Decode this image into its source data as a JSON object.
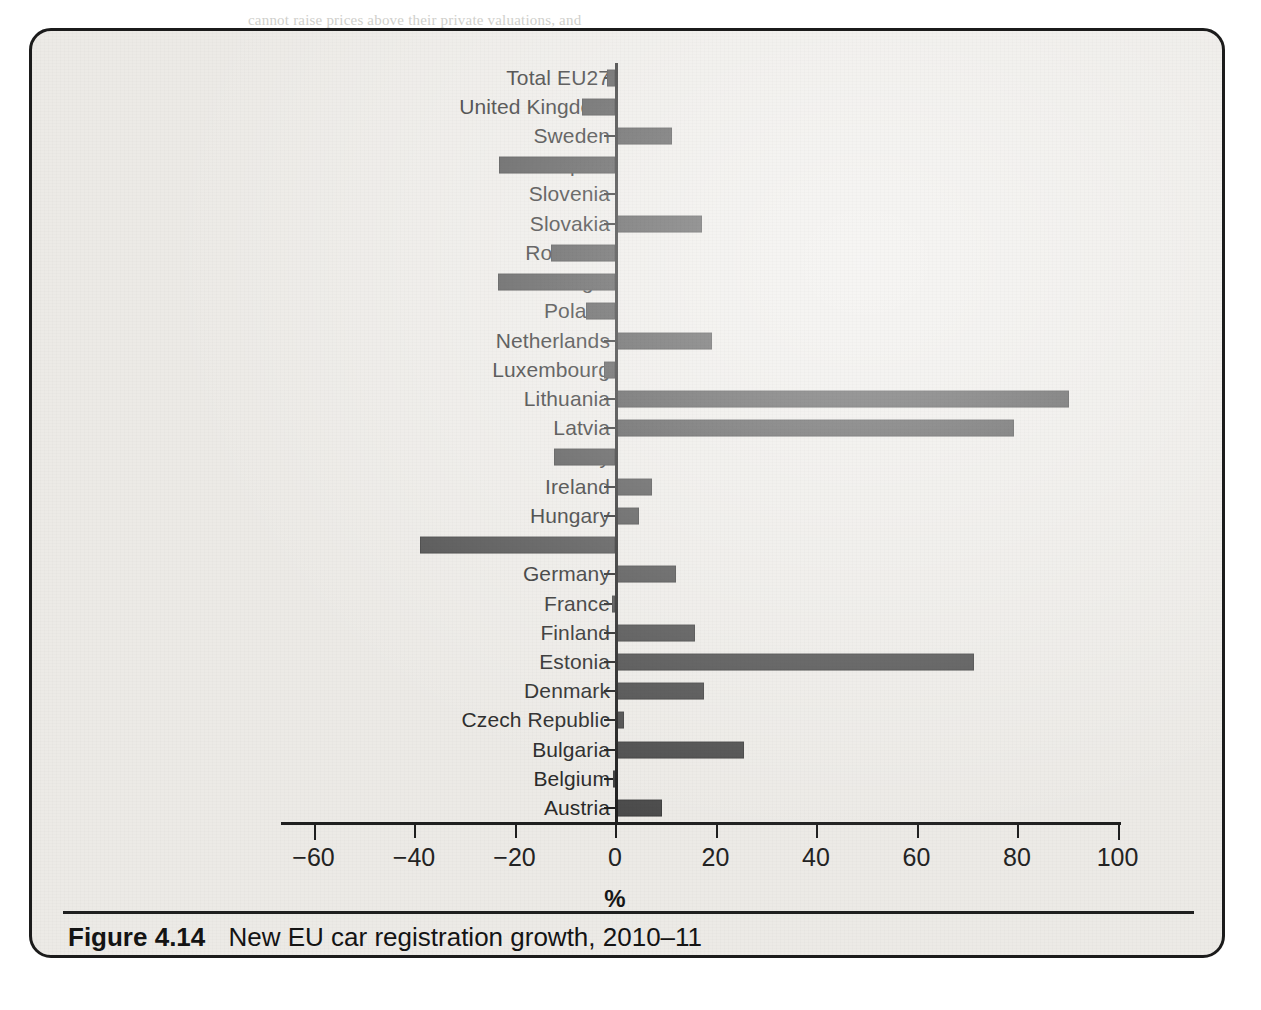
{
  "figure": {
    "number_label": "Figure 4.14",
    "caption": "New EU car registration growth, 2010–11",
    "bar_color": "#4b4b4b",
    "panel_color": "#eceae6",
    "axis_color": "#1f1f1f"
  },
  "chart_data": {
    "type": "bar",
    "orientation": "horizontal",
    "title": "New EU car registration growth, 2010–11",
    "xlabel": "%",
    "ylabel": "",
    "xlim": [
      -60,
      100
    ],
    "xticks": [
      -60,
      -40,
      -20,
      0,
      20,
      40,
      60,
      80,
      100
    ],
    "xtick_labels": [
      "−60",
      "−40",
      "−20",
      "0",
      "20",
      "40",
      "60",
      "80",
      "100"
    ],
    "grid": false,
    "legend": "none",
    "zero_reference_line": 0,
    "categories": [
      "Total EU27",
      "United Kingdom",
      "Sweden",
      "Spain",
      "Slovenia",
      "Slovakia",
      "Romania",
      "Portugal",
      "Poland",
      "Netherlands",
      "Luxembourg",
      "Lithuania",
      "Latvia",
      "Italy",
      "Ireland",
      "Hungary",
      "Greece",
      "Germany",
      "France",
      "Finland",
      "Estonia",
      "Denmark",
      "Czech Republic",
      "Bulgaria",
      "Belgium",
      "Austria"
    ],
    "values": [
      -1.5,
      -6.6,
      11.0,
      -23.0,
      0.0,
      17.0,
      -12.7,
      -23.3,
      -5.8,
      18.9,
      -2.2,
      90.0,
      79.0,
      -12.1,
      7.0,
      4.4,
      -38.8,
      11.7,
      -0.5,
      15.5,
      71.0,
      17.3,
      1.4,
      25.3,
      -0.3,
      9.0
    ]
  },
  "page_bleed": {
    "lines": [
      {
        "text": "cannot raise prices above their private valuations, and",
        "x": 248,
        "y": 12
      },
      {
        "text": "suppose all of the surplus goes to the consumers; the market rent will accrue to the landowner, who will be",
        "x": 118,
        "y": 60
      },
      {
        "text": "b. So it will have a surplus supply and in order to clear the market it has to reduce price to the",
        "x": 150,
        "y": 88
      },
      {
        "text": "equilibrium price in the months ahead.",
        "x": 262,
        "y": 116
      },
      {
        "text": "c. What if the interest rate is less than the maximum demand willingness to pay and this",
        "x": 118,
        "y": 150
      },
      {
        "text": "is faced with a shortage. The market in the medium run may generate",
        "x": 216,
        "y": 178
      },
      {
        "text": "sizeable shifts in the world market as quantity demanded rises again.",
        "x": 216,
        "y": 206
      },
      {
        "text": "2.  Suppose a market that has the inverse demand curve given by",
        "x": 170,
        "y": 244
      },
      {
        "text": "and a supply of the commodity that is set by the previous season, so",
        "x": 216,
        "y": 272
      },
      {
        "text": "that quantity supplied is fixed. What is the equilibrium price in this",
        "x": 216,
        "y": 300
      },
      {
        "text": "case? If a higher-quality product becomes available instead,",
        "x": 216,
        "y": 328
      },
      {
        "text": "and it lowers the world business surplus generated by the market, show what happens to",
        "x": 118,
        "y": 360
      },
      {
        "text": "them. Then, calculate the total surplus.",
        "x": 216,
        "y": 388
      },
      {
        "text": "3.  Explain, using your own words, the market surplus for the following and illustrate it",
        "x": 118,
        "y": 420
      },
      {
        "text": "graphically in each case. Say whether it generates a surplus or not.",
        "x": 216,
        "y": 448
      },
      {
        "text": "a. A decrease in the price of a substitute in supply. (Answer)",
        "x": 216,
        "y": 476
      }
    ],
    "heading": {
      "text": "Around the Market",
      "x": 760,
      "y": 528
    },
    "tail_lines": [
      {
        "text": "b. The price level of a product that is complementary to it, supposing that it trades",
        "x": 108,
        "y": 572
      },
      {
        "text": "above the equilibrium.",
        "x": 216,
        "y": 600
      },
      {
        "text": "c. An increase in supply and an increase in demand, both by the same proportion.",
        "x": 118,
        "y": 628
      }
    ]
  }
}
